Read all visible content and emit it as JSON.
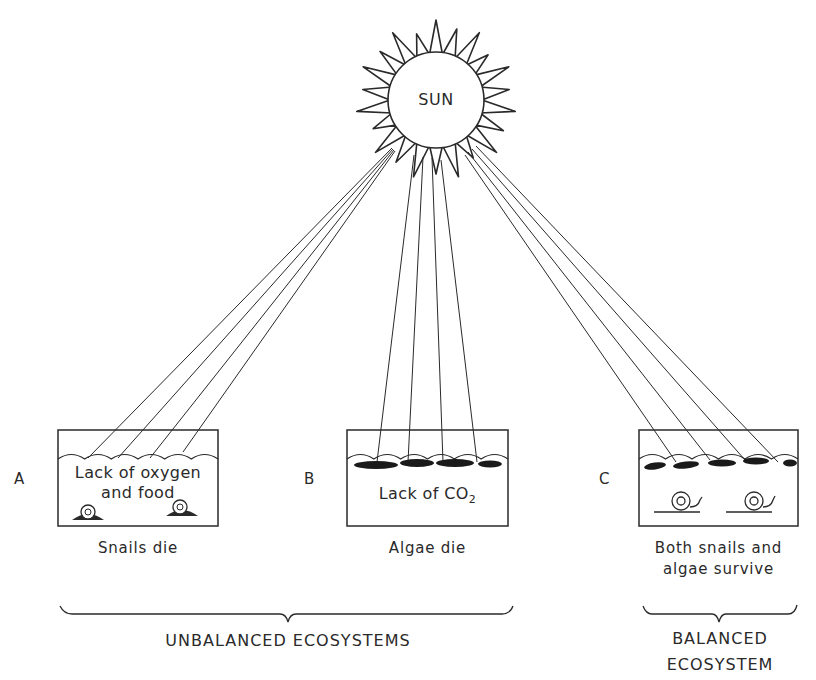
{
  "sun": {
    "label": "SUN"
  },
  "ecosystems": [
    {
      "id": "A",
      "letter": "A",
      "condition": "Lack of oxygen and food",
      "condition_line1": "Lack of oxygen",
      "condition_line2": "and food",
      "outcome": "Snails die",
      "contents": [
        "snails"
      ]
    },
    {
      "id": "B",
      "letter": "B",
      "condition_prefix": "Lack of CO",
      "condition_subscript": "2",
      "outcome": "Algae die",
      "contents": [
        "algae"
      ]
    },
    {
      "id": "C",
      "letter": "C",
      "outcome_line1": "Both snails and",
      "outcome_line2": "algae survive",
      "contents": [
        "algae",
        "snails"
      ]
    }
  ],
  "groups": {
    "unbalanced": {
      "label": "UNBALANCED ECOSYSTEMS",
      "members": [
        "A",
        "B"
      ]
    },
    "balanced": {
      "label_line1": "BALANCED",
      "label_line2": "ECOSYSTEM",
      "members": [
        "C"
      ]
    }
  },
  "colors": {
    "ink": "#2a2a2a",
    "background": "#ffffff"
  }
}
